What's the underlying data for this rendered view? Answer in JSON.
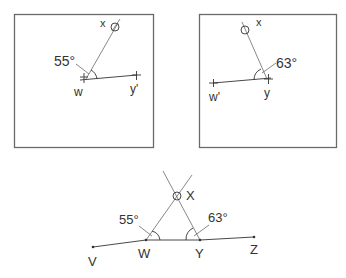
{
  "panels": [
    {
      "id": "left",
      "angle_label": "55°",
      "points": {
        "sight": "x",
        "station": "w",
        "reference": "y'"
      }
    },
    {
      "id": "right",
      "angle_label": "63°",
      "points": {
        "sight": "x",
        "station": "y",
        "reference": "w'"
      }
    }
  ],
  "combined": {
    "angle_left": "55°",
    "angle_right": "63°",
    "points": {
      "intersection": "X",
      "station_a": "W",
      "station_b": "Y",
      "end_left": "V",
      "end_right": "Z"
    }
  }
}
